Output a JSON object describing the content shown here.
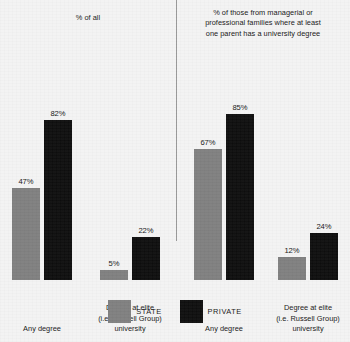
{
  "chart_data": {
    "type": "bar",
    "title": "",
    "xlabel": "",
    "ylabel": "",
    "ylim": [
      0,
      90
    ],
    "grid": false,
    "legend_position": "bottom-center",
    "legend": [
      "STATE",
      "PRIVATE"
    ],
    "panels": [
      {
        "title": "% of all",
        "categories": [
          "Any degree",
          "Degree at elite (i.e. Russell Group) university"
        ],
        "series": [
          {
            "name": "STATE",
            "color": "#7f7f7f",
            "values": [
              47,
              5
            ],
            "labels": [
              "47%",
              "5%"
            ]
          },
          {
            "name": "PRIVATE",
            "color": "#0d0d0d",
            "values": [
              82,
              22
            ],
            "labels": [
              "82%",
              "22%"
            ]
          }
        ]
      },
      {
        "title": "% of those from managerial or professional families where at least one parent has a university degree",
        "categories": [
          "Any degree",
          "Degree at elite (i.e. Russell Group) university"
        ],
        "series": [
          {
            "name": "STATE",
            "color": "#7f7f7f",
            "values": [
              67,
              12
            ],
            "labels": [
              "67%",
              "12%"
            ]
          },
          {
            "name": "PRIVATE",
            "color": "#0d0d0d",
            "values": [
              85,
              24
            ],
            "labels": [
              "85%",
              "24%"
            ]
          }
        ]
      }
    ]
  },
  "panel_left": {
    "title": "% of all",
    "group1": {
      "label_line1": "Any degree",
      "label_line2": "",
      "label_line3": "",
      "state_value": "47%",
      "private_value": "82%"
    },
    "group2": {
      "label_line1": "Degree at elite",
      "label_line2": "(i.e. Russell Group)",
      "label_line3": "university",
      "state_value": "5%",
      "private_value": "22%"
    }
  },
  "panel_right": {
    "title_line1": "% of those from managerial or",
    "title_line2": "professional families where at least",
    "title_line3": "one parent has a university degree",
    "group1": {
      "label_line1": "Any degree",
      "label_line2": "",
      "label_line3": "",
      "state_value": "67%",
      "private_value": "85%"
    },
    "group2": {
      "label_line1": "Degree at elite",
      "label_line2": "(i.e. Russell Group)",
      "label_line3": "university",
      "state_value": "12%",
      "private_value": "24%"
    }
  },
  "legend": {
    "state_label": "STATE",
    "private_label": "PRIVATE",
    "state_color": "#7f7f7f",
    "private_color": "#0d0d0d"
  },
  "scale": {
    "px_per_percent": 1.95,
    "baseline_y": 228
  }
}
